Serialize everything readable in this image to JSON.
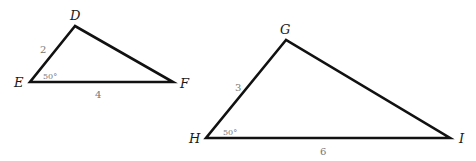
{
  "triangles": [
    {
      "name": "DEF",
      "vertices": {
        "D": "D",
        "E": "E",
        "F": "F"
      },
      "sides": {
        "DE": "2",
        "EF": "4"
      },
      "angle_E": "50°"
    },
    {
      "name": "GHI",
      "vertices": {
        "G": "G",
        "H": "H",
        "I": "I"
      },
      "sides": {
        "GH": "3",
        "HI": "6"
      },
      "angle_H": "50°"
    }
  ],
  "colors": {
    "lines": "#111111",
    "labels": "#1a1a1a",
    "measures": "#777777"
  }
}
